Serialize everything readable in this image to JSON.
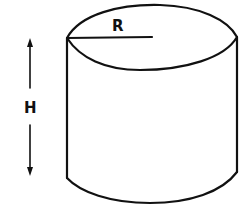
{
  "diagram": {
    "type": "cylinder",
    "labels": {
      "radius": "R",
      "height": "H"
    },
    "colors": {
      "stroke": "#111111",
      "background": "#ffffff"
    }
  }
}
